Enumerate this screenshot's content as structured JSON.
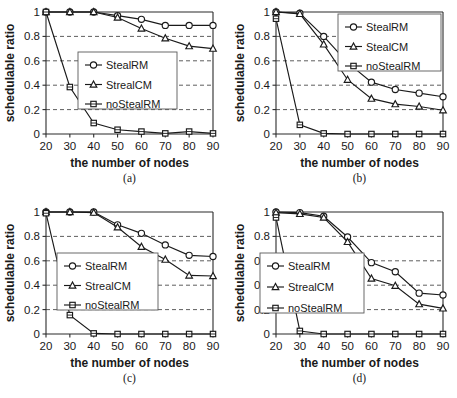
{
  "figure": {
    "panel_count": 4,
    "shared_xlabel": "the number of nodes",
    "shared_ylabel": "schedulable ratio"
  },
  "chart_data": [
    {
      "type": "line",
      "panel_id": "a",
      "caption": "(a)",
      "title": "",
      "xlabel": "the number of nodes",
      "ylabel": "schedulable ratio",
      "x": [
        20,
        30,
        40,
        50,
        60,
        70,
        80,
        90
      ],
      "xticklabels": [
        "20",
        "30",
        "40",
        "50",
        "60",
        "70",
        "80",
        "90"
      ],
      "yticklabels": [
        "0",
        "0.2",
        "0.4",
        "0.6",
        "0.8",
        "1"
      ],
      "ylim": [
        0,
        1
      ],
      "xlim": [
        20,
        90
      ],
      "ytick_values": [
        0,
        0.2,
        0.4,
        0.6,
        0.8,
        1
      ],
      "grid": true,
      "legend_position": "center-right",
      "series": [
        {
          "name": "StealRM",
          "marker": "circle",
          "values": [
            1.0,
            1.0,
            1.0,
            0.97,
            0.94,
            0.89,
            0.89,
            0.89
          ]
        },
        {
          "name": "StrealCM",
          "marker": "triangle",
          "values": [
            1.0,
            1.0,
            1.0,
            0.955,
            0.865,
            0.785,
            0.72,
            0.7
          ]
        },
        {
          "name": "noStealRM",
          "marker": "square",
          "values": [
            1.0,
            0.385,
            0.09,
            0.035,
            0.02,
            0.005,
            0.02,
            0.005
          ]
        }
      ]
    },
    {
      "type": "line",
      "panel_id": "b",
      "caption": "(b)",
      "title": "",
      "xlabel": "the number of nodes",
      "ylabel": "schedulable ratio",
      "x": [
        20,
        30,
        40,
        50,
        60,
        70,
        80,
        90
      ],
      "xticklabels": [
        "20",
        "30",
        "40",
        "50",
        "60",
        "70",
        "80",
        "90"
      ],
      "yticklabels": [
        "0",
        "0.2",
        "0.4",
        "0.6",
        "0.8",
        "1"
      ],
      "ylim": [
        0,
        1
      ],
      "xlim": [
        20,
        90
      ],
      "ytick_values": [
        0,
        0.2,
        0.4,
        0.6,
        0.8,
        1
      ],
      "grid": true,
      "legend_position": "top-right",
      "series": [
        {
          "name": "StealRM",
          "marker": "circle",
          "values": [
            1.0,
            0.99,
            0.8,
            0.585,
            0.425,
            0.365,
            0.335,
            0.305
          ]
        },
        {
          "name": "StealCM",
          "marker": "triangle",
          "values": [
            1.0,
            0.985,
            0.735,
            0.445,
            0.29,
            0.245,
            0.225,
            0.195
          ]
        },
        {
          "name": "noStealRM",
          "marker": "square",
          "values": [
            0.945,
            0.075,
            0.005,
            0.0,
            0.0,
            0.0,
            0.0,
            0.0
          ]
        }
      ]
    },
    {
      "type": "line",
      "panel_id": "c",
      "caption": "(c)",
      "title": "",
      "xlabel": "the number of nodes",
      "ylabel": "schedulable ratio",
      "x": [
        20,
        30,
        40,
        50,
        60,
        70,
        80,
        90
      ],
      "xticklabels": [
        "20",
        "30",
        "40",
        "50",
        "60",
        "70",
        "80",
        "90"
      ],
      "yticklabels": [
        "0",
        "0.2",
        "0.4",
        "0.6",
        "0.8",
        "1"
      ],
      "ylim": [
        0,
        1
      ],
      "xlim": [
        20,
        90
      ],
      "ytick_values": [
        0,
        0.2,
        0.4,
        0.6,
        0.8,
        1
      ],
      "grid": true,
      "legend_position": "center-left",
      "series": [
        {
          "name": "StealRM",
          "marker": "circle",
          "values": [
            1.0,
            1.0,
            1.0,
            0.895,
            0.825,
            0.73,
            0.645,
            0.635
          ]
        },
        {
          "name": "StrealCM",
          "marker": "triangle",
          "values": [
            1.0,
            1.0,
            0.995,
            0.875,
            0.715,
            0.61,
            0.48,
            0.475
          ]
        },
        {
          "name": "noStealRM",
          "marker": "square",
          "values": [
            0.99,
            0.155,
            0.005,
            0.0,
            0.0,
            0.0,
            0.0,
            0.0
          ]
        }
      ]
    },
    {
      "type": "line",
      "panel_id": "d",
      "caption": "(d)",
      "title": "",
      "xlabel": "the number of nodes",
      "ylabel": "schedulable ratio",
      "x": [
        20,
        30,
        40,
        50,
        60,
        70,
        80,
        90
      ],
      "xticklabels": [
        "20",
        "30",
        "40",
        "50",
        "60",
        "70",
        "80",
        "90"
      ],
      "yticklabels": [
        "0",
        "0.2",
        "0.4",
        "0.6",
        "0.8",
        "1"
      ],
      "ylim": [
        0,
        1
      ],
      "xlim": [
        20,
        90
      ],
      "ytick_values": [
        0,
        0.2,
        0.4,
        0.6,
        0.8,
        1
      ],
      "grid": true,
      "legend_position": "center-left",
      "series": [
        {
          "name": "StealRM",
          "marker": "circle",
          "values": [
            1.0,
            0.995,
            0.965,
            0.795,
            0.585,
            0.51,
            0.335,
            0.32
          ]
        },
        {
          "name": "StrealCM",
          "marker": "triangle",
          "values": [
            0.995,
            0.985,
            0.955,
            0.755,
            0.455,
            0.395,
            0.245,
            0.21
          ]
        },
        {
          "name": "noStealRM",
          "marker": "square",
          "values": [
            0.955,
            0.025,
            0.0,
            0.0,
            0.0,
            0.0,
            0.0,
            0.0
          ]
        }
      ]
    }
  ]
}
